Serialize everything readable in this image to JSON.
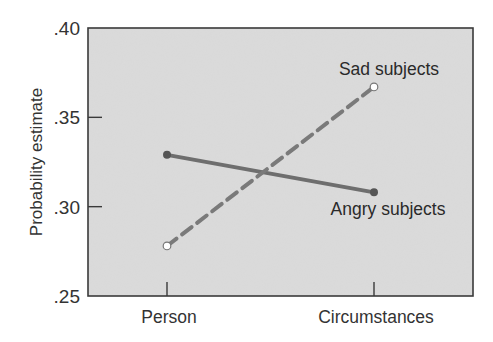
{
  "chart_data": {
    "type": "line",
    "title": "",
    "xlabel": "",
    "ylabel": "Probability estimate",
    "categories": [
      "Person",
      "Circumstances"
    ],
    "ylim": [
      0.25,
      0.4
    ],
    "yticks": [
      ".25",
      ".30",
      ".35",
      ".40"
    ],
    "ytick_values": [
      0.25,
      0.3,
      0.35,
      0.4
    ],
    "grid": false,
    "legend": "inline labels",
    "series": [
      {
        "name": "Angry subjects",
        "values": [
          0.329,
          0.308
        ],
        "style": "solid",
        "marker": "filled",
        "color": "#6e6e6e"
      },
      {
        "name": "Sad subjects",
        "values": [
          0.278,
          0.367
        ],
        "style": "dashed",
        "marker": "open",
        "color": "#7a7a7a"
      }
    ]
  },
  "colors": {
    "plot_background": "#d9d9d9",
    "frame": "#3a3a3a",
    "page_background": "#ffffff"
  }
}
